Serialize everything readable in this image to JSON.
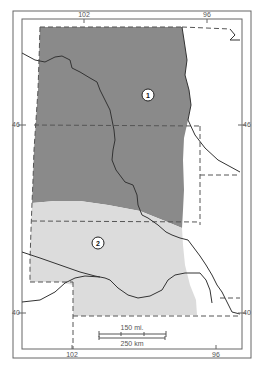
{
  "map": {
    "type": "regional-map",
    "longitude_labels_top": [
      "102",
      "96"
    ],
    "longitude_labels_bottom": [
      "102",
      "96"
    ],
    "latitude_labels_left": [
      "46",
      "40"
    ],
    "latitude_labels_right": [
      "46",
      "40"
    ],
    "regions": [
      {
        "id": "1",
        "label": "1",
        "fill": "#8a8a8a"
      },
      {
        "id": "2",
        "label": "2",
        "fill": "#dcdcdc"
      }
    ],
    "scale_bar": {
      "miles_label": "150 mi.",
      "km_label": "250 km"
    },
    "colors": {
      "frame": "#666666",
      "region_1": "#8a8a8a",
      "region_2": "#dcdcdc",
      "rivers": "#444444",
      "boundaries": "#555555"
    }
  }
}
